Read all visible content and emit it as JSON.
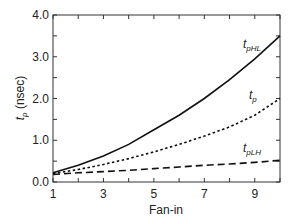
{
  "chart_data": {
    "type": "line",
    "title": "",
    "xlabel": "Fan-in",
    "ylabel": "t_p (nsec)",
    "ylabel_main": "t",
    "ylabel_sub": "p",
    "ylabel_unit": " (nsec)",
    "xlim": [
      1,
      10
    ],
    "ylim": [
      0.0,
      4.0
    ],
    "grid": false,
    "legend": "inline labels",
    "x": [
      1,
      2,
      3,
      4,
      5,
      6,
      7,
      8,
      9,
      10
    ],
    "x_ticks": [
      1,
      3,
      5,
      7,
      9
    ],
    "x_tick_labels": [
      "1",
      "3",
      "5",
      "7",
      "9"
    ],
    "y_ticks": [
      0.0,
      1.0,
      2.0,
      3.0,
      4.0
    ],
    "y_tick_labels": [
      "0.0",
      "1.0",
      "2.0",
      "3.0",
      "4.0"
    ],
    "series": [
      {
        "name": "tpHL",
        "label_main": "t",
        "label_sub": "pHL",
        "style": "solid",
        "values": [
          0.22,
          0.4,
          0.62,
          0.9,
          1.25,
          1.6,
          2.0,
          2.45,
          2.95,
          3.5
        ]
      },
      {
        "name": "tp",
        "label_main": "t",
        "label_sub": "p",
        "style": "dotted",
        "values": [
          0.2,
          0.3,
          0.42,
          0.56,
          0.72,
          0.9,
          1.1,
          1.32,
          1.6,
          2.0
        ]
      },
      {
        "name": "tpLH",
        "label_main": "t",
        "label_sub": "pLH",
        "style": "dashed",
        "values": [
          0.18,
          0.22,
          0.25,
          0.28,
          0.32,
          0.36,
          0.4,
          0.43,
          0.47,
          0.52
        ]
      }
    ]
  }
}
